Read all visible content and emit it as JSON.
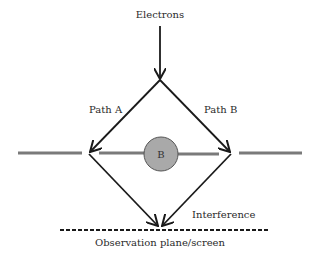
{
  "diagram": {
    "title_source_label": "Electrons",
    "path_a_label": "Path A",
    "path_b_label": "Path B",
    "region_label": "B",
    "interference_label": "Interference",
    "screen_label": "Observation plane/screen"
  },
  "colors": {
    "lines": "#1a1a1a",
    "barrier": "#7a7a7a",
    "circle_fill": "#a9a9a9",
    "circle_stroke": "#555555"
  }
}
